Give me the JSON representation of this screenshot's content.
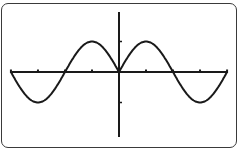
{
  "chart_data": {
    "type": "line",
    "title": "",
    "function": "y = sin(|x|)",
    "xlabel": "",
    "ylabel": "",
    "xlim": [
      -6.283,
      6.283
    ],
    "ylim": [
      -2.1,
      2.0
    ],
    "xticks": [
      -6.283,
      -4.712,
      -3.142,
      -1.571,
      0,
      1.571,
      3.142,
      4.712,
      6.283
    ],
    "yticks": [
      -1,
      1
    ],
    "grid": false,
    "legend": null,
    "series": [
      {
        "name": "y = sin(|x|)",
        "x": [
          -6.283,
          -5.498,
          -4.712,
          -3.927,
          -3.142,
          -2.356,
          -1.571,
          -0.785,
          0,
          0.785,
          1.571,
          2.356,
          3.142,
          3.927,
          4.712,
          5.498,
          6.283
        ],
        "values": [
          0,
          -0.707,
          -1,
          -0.707,
          0,
          0.707,
          1,
          0.707,
          0,
          0.707,
          1,
          0.707,
          0,
          -0.707,
          -1,
          -0.707,
          0
        ]
      }
    ],
    "colors": {
      "curve": "#1a1a1a",
      "axes": "#1a1a1a",
      "frame": "#3a3a3a",
      "background": "#ffffff"
    }
  },
  "layout": {
    "origin_px": [
      119,
      72
    ],
    "x_px_per_unit": 17.2,
    "y_px_per_unit": 30.5,
    "x_axis_px_range": [
      12,
      228
    ],
    "y_axis_px_range": [
      12,
      137
    ]
  }
}
